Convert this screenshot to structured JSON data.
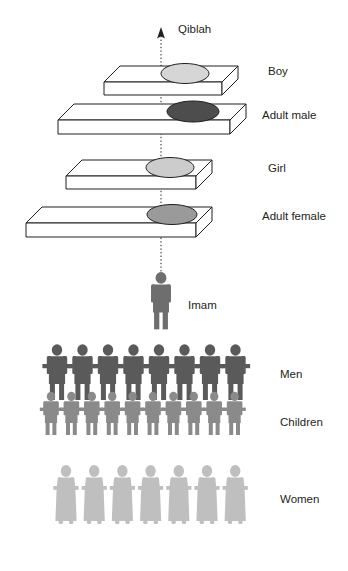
{
  "diagram": {
    "title_label": "Qiblah",
    "direction_icon": "up-arrow-icon",
    "center_line_icon": "dotted-qiblah-line-icon",
    "biers": [
      {
        "label": "Boy",
        "body_fill": "#d6d6d6",
        "bier_fill": "#ffffff",
        "length": "short",
        "x": 104,
        "y": 62,
        "width": 118,
        "label_x": 268,
        "label_y": 72
      },
      {
        "label": "Adult male",
        "body_fill": "#4d4d4d",
        "bier_fill": "#ffffff",
        "length": "long",
        "x": 58,
        "y": 100,
        "width": 164,
        "label_x": 262,
        "label_y": 112
      },
      {
        "label": "Girl",
        "body_fill": "#cccccc",
        "bier_fill": "#ffffff",
        "length": "short",
        "x": 66,
        "y": 158,
        "width": 130,
        "label_x": 268,
        "label_y": 166
      },
      {
        "label": "Adult female",
        "body_fill": "#9a9a9a",
        "bier_fill": "#ffffff",
        "length": "long",
        "x": 26,
        "y": 205,
        "width": 170,
        "label_x": 262,
        "label_y": 212
      }
    ],
    "imam": {
      "label": "Imam",
      "fill": "#6e6e6e",
      "label_x": 188,
      "label_y": 305
    },
    "rows": [
      {
        "label": "Men",
        "fill": "#5a5a5a",
        "count": 8,
        "label_x": 280,
        "label_y": 375
      },
      {
        "label": "Children",
        "fill": "#8a8a8a",
        "count": 10,
        "label_x": 280,
        "label_y": 423
      },
      {
        "label": "Women",
        "fill": "#bfbfbf",
        "count": 7,
        "label_x": 280,
        "label_y": 500
      }
    ],
    "colors": {
      "outline": "#231f20",
      "text": "#231f20",
      "background": "#ffffff"
    }
  }
}
